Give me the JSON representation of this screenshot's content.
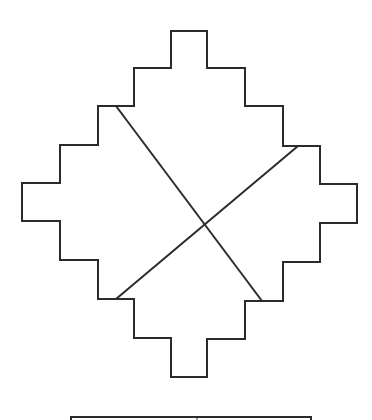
{
  "diagram": {
    "type": "stepped-diamond-with-crossing-diagonals",
    "stroke_color": "#2b2b2b",
    "background": "#ffffff",
    "outline_points": [
      [
        171,
        31
      ],
      [
        207,
        31
      ],
      [
        207,
        68
      ],
      [
        245,
        68
      ],
      [
        245,
        106
      ],
      [
        283,
        106
      ],
      [
        283,
        146
      ],
      [
        320,
        146
      ],
      [
        320,
        184
      ],
      [
        357,
        184
      ],
      [
        357,
        223
      ],
      [
        320,
        223
      ],
      [
        320,
        262
      ],
      [
        283,
        262
      ],
      [
        283,
        301
      ],
      [
        245,
        301
      ],
      [
        245,
        339
      ],
      [
        207,
        339
      ],
      [
        207,
        377
      ],
      [
        171,
        377
      ],
      [
        171,
        338
      ],
      [
        134,
        338
      ],
      [
        134,
        299
      ],
      [
        98,
        299
      ],
      [
        98,
        260
      ],
      [
        60,
        260
      ],
      [
        60,
        221
      ],
      [
        22,
        221
      ],
      [
        22,
        183
      ],
      [
        60,
        183
      ],
      [
        60,
        145
      ],
      [
        98,
        145
      ],
      [
        98,
        106
      ],
      [
        134,
        106
      ],
      [
        134,
        68
      ],
      [
        171,
        68
      ]
    ],
    "diagonals": [
      {
        "x1": 116,
        "y1": 106,
        "x2": 262,
        "y2": 301
      },
      {
        "x1": 298,
        "y1": 146,
        "x2": 116,
        "y2": 299
      }
    ],
    "base_bar": {
      "x": 71,
      "y": 417,
      "width": 240,
      "height": 4,
      "tick_x": 197
    }
  }
}
